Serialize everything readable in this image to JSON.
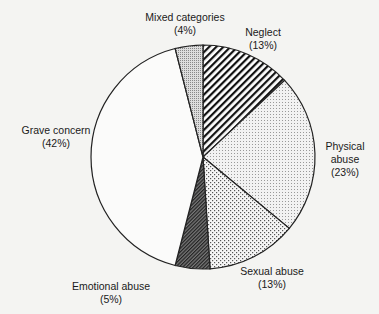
{
  "chart_data": {
    "type": "pie",
    "title": "",
    "start_angle_deg": 0,
    "direction": "clockwise",
    "slices": [
      {
        "label": "Neglect",
        "pct_label": "(13%)",
        "value": 13,
        "pattern": "diagonal-hatch"
      },
      {
        "label": "Physical abuse",
        "pct_label": "(23%)",
        "value": 23,
        "pattern": "fine-dots"
      },
      {
        "label": "Sexual abuse",
        "pct_label": "(13%)",
        "value": 13,
        "pattern": "crosshatch-dots"
      },
      {
        "label": "Emotional abuse",
        "pct_label": "(5%)",
        "value": 5,
        "pattern": "dense-dark-hatch"
      },
      {
        "label": "Grave concern",
        "pct_label": "(42%)",
        "value": 42,
        "pattern": "none"
      },
      {
        "label": "Mixed categories",
        "pct_label": "(4%)",
        "value": 4,
        "pattern": "medium-dots"
      }
    ]
  },
  "labels": {
    "neglect": {
      "name": "Neglect",
      "pct": "(13%)"
    },
    "physical": {
      "name": "Physical",
      "name2": "abuse",
      "pct": "(23%)"
    },
    "sexual": {
      "name": "Sexual abuse",
      "pct": "(13%)"
    },
    "emotional": {
      "name": "Emotional abuse",
      "pct": "(5%)"
    },
    "grave": {
      "name": "Grave concern",
      "pct": "(42%)"
    },
    "mixed": {
      "name": "Mixed categories",
      "pct": "(4%)"
    }
  }
}
